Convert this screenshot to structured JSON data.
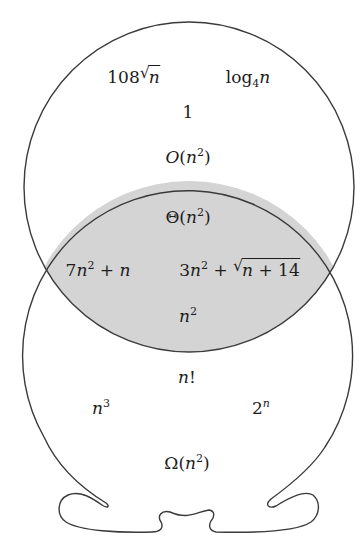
{
  "figure": {
    "type": "venn-diagram",
    "colors": {
      "stroke": "#3a3a3a",
      "lens_fill": "#d4d4d4",
      "background": "#ffffff",
      "text": "#1c1c1c"
    },
    "regions": {
      "upper_set": {
        "label": "O(n²)",
        "members": [
          "108√n",
          "log₄n",
          "1"
        ]
      },
      "intersection": {
        "label": "Θ(n²)",
        "members": [
          "7n² + n",
          "3n² + √(n + 14)",
          "n²"
        ]
      },
      "lower_set": {
        "label": "Ω(n²)",
        "members": [
          "n!",
          "n³",
          "2ⁿ"
        ]
      }
    }
  },
  "labels": {
    "l108": {
      "coef": "108",
      "var": "n"
    },
    "log": {
      "base_fn": "log",
      "sub": "4",
      "var": "n"
    },
    "one": "1",
    "bigO": {
      "sym": "O",
      "open": "(",
      "var": "n",
      "exp": "2",
      "close": ")"
    },
    "theta": {
      "sym": "Θ",
      "open": "(",
      "var": "n",
      "exp": "2",
      "close": ")"
    },
    "f7": {
      "coef": "7",
      "var": "n",
      "exp": "2",
      "op": " + ",
      "var2": "n"
    },
    "f3": {
      "coef": "3",
      "var": "n",
      "exp": "2",
      "op": " + ",
      "rad": "√",
      "inner_var": "n",
      "inner_rest": " + 14"
    },
    "nsq": {
      "var": "n",
      "exp": "2"
    },
    "nfact": {
      "var": "n",
      "bang": "!"
    },
    "ncube": {
      "var": "n",
      "exp": "3"
    },
    "twon": {
      "base": "2",
      "exp": "n"
    },
    "omega": {
      "sym": "Ω",
      "open": "(",
      "var": "n",
      "exp": "2",
      "close": ")"
    }
  }
}
